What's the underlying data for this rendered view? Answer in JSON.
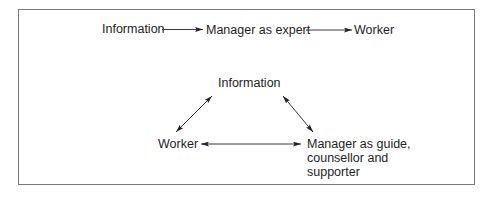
{
  "diagram": {
    "top_flow": {
      "nodes": [
        {
          "id": "info",
          "label": "Information"
        },
        {
          "id": "manager_expert",
          "label": "Manager as expert"
        },
        {
          "id": "worker",
          "label": "Worker"
        }
      ],
      "edges": [
        {
          "from": "info",
          "to": "manager_expert",
          "type": "one-way"
        },
        {
          "from": "manager_expert",
          "to": "worker",
          "type": "one-way"
        }
      ]
    },
    "triangle": {
      "nodes": [
        {
          "id": "info",
          "label": "Information"
        },
        {
          "id": "worker",
          "label": "Worker"
        },
        {
          "id": "manager_guide",
          "label_lines": [
            "Manager as guide,",
            "counsellor and",
            "supporter"
          ]
        }
      ],
      "edges": [
        {
          "from": "worker",
          "to": "info",
          "type": "two-way"
        },
        {
          "from": "info",
          "to": "manager_guide",
          "type": "two-way"
        },
        {
          "from": "worker",
          "to": "manager_guide",
          "type": "two-way"
        }
      ]
    },
    "colors": {
      "text": "#1e1e1e",
      "arrow": "#222222",
      "border": "#7a7a7a",
      "background": "#ffffff"
    }
  }
}
